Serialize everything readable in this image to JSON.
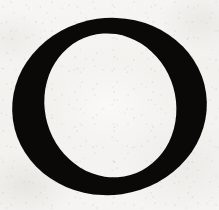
{
  "page": {
    "kind": "scanned-drop-cap",
    "width_px": 219,
    "height_px": 210,
    "caption": ""
  },
  "paper": {
    "background_color": "#f4f3f1",
    "highlight_color": "#f8f7f5",
    "shadow_color": "#d2cec7",
    "texture": "speckled aged paper"
  },
  "dropcap": {
    "character": "O",
    "letterform": "serif capital O",
    "ink_color": "#0a0908",
    "stress": "oblique",
    "outer": {
      "cx": 109.5,
      "cy": 106.5,
      "rx": 97.5,
      "ry": 88.5
    },
    "counter": {
      "cx": 110.5,
      "cy": 105.5,
      "rx": 65.5,
      "ry": 72.5
    },
    "stroke_left_px": 32,
    "stroke_right_px": 35,
    "stroke_top_px": 15,
    "stroke_bottom_px": 16,
    "rotation_deg": -8
  }
}
